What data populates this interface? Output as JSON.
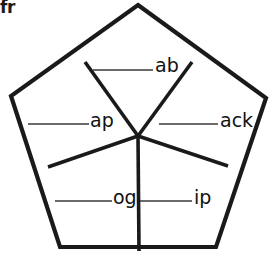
{
  "worksheet": {
    "corner_label": "fr",
    "ink_color": "#1a1a1a",
    "rule_color": "#3a3a3a",
    "background_color": "#ffffff",
    "shape": "pentagon",
    "segment_count": 5
  },
  "figure": {
    "outer_vertices": [
      {
        "name": "top-apex",
        "x": 138,
        "y": 5
      },
      {
        "name": "right-upper",
        "x": 266,
        "y": 98
      },
      {
        "name": "right-lower",
        "x": 216,
        "y": 247
      },
      {
        "name": "left-lower",
        "x": 60,
        "y": 247
      },
      {
        "name": "left-upper",
        "x": 11,
        "y": 96
      }
    ],
    "center": {
      "x": 138,
      "y": 136
    },
    "inner_vertices": [
      {
        "name": "edge-top-left",
        "x": 85,
        "y": 62
      },
      {
        "name": "edge-top-right",
        "x": 192,
        "y": 62
      },
      {
        "name": "edge-right",
        "x": 228,
        "y": 166
      },
      {
        "name": "edge-bottom",
        "x": 139,
        "y": 251
      },
      {
        "name": "edge-left",
        "x": 48,
        "y": 167
      }
    ]
  },
  "segments": [
    {
      "id": "ab",
      "position": "top",
      "label": "ab",
      "label_x": 155,
      "label_y": 72,
      "rule": {
        "x1": 93,
        "y1": 70,
        "x2": 153,
        "y2": 70
      }
    },
    {
      "id": "ap",
      "position": "upper-left",
      "label": "ap",
      "label_x": 90,
      "label_y": 127,
      "rule": {
        "x1": 28,
        "y1": 124,
        "x2": 89,
        "y2": 124
      }
    },
    {
      "id": "ack",
      "position": "upper-right",
      "label": "ack",
      "label_x": 220,
      "label_y": 127,
      "rule": {
        "x1": 159,
        "y1": 124,
        "x2": 218,
        "y2": 124
      }
    },
    {
      "id": "og",
      "position": "lower-left",
      "label": "og",
      "label_x": 113,
      "label_y": 204,
      "rule": {
        "x1": 55,
        "y1": 201,
        "x2": 112,
        "y2": 201
      }
    },
    {
      "id": "ip",
      "position": "lower-right",
      "label": "ip",
      "label_x": 194,
      "label_y": 204,
      "rule": {
        "x1": 140,
        "y1": 201,
        "x2": 192,
        "y2": 201
      }
    }
  ]
}
